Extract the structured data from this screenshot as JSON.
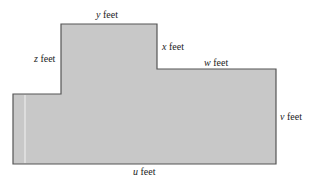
{
  "diagram": {
    "type": "floor-plan-dimensions",
    "colors": {
      "fill": "#c8c8c8",
      "stroke": "#555555",
      "highlight_line": "#f2f2f2",
      "background": "#ffffff"
    },
    "labels": {
      "top": {
        "var": "y",
        "unit": "feet"
      },
      "left_upper": {
        "var": "z",
        "unit": "feet"
      },
      "step_vertical": {
        "var": "x",
        "unit": "feet"
      },
      "step_horizontal": {
        "var": "w",
        "unit": "feet"
      },
      "right": {
        "var": "v",
        "unit": "feet"
      },
      "bottom": {
        "var": "u",
        "unit": "feet"
      }
    }
  }
}
